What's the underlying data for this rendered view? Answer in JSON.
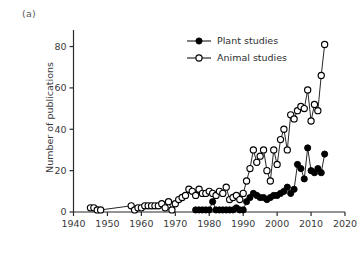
{
  "panel": {
    "label": "(a)"
  },
  "chart_data": {
    "type": "line",
    "title": "",
    "subtitle": "",
    "xlabel": "",
    "ylabel": "Number of publications",
    "xlim": [
      1940,
      2020
    ],
    "ylim": [
      0,
      88
    ],
    "xticks": [
      1940,
      1950,
      1960,
      1970,
      1980,
      1990,
      2000,
      2010,
      2020
    ],
    "yticks": [
      0,
      20,
      40,
      60,
      80
    ],
    "grid": false,
    "legend_position": "top-center",
    "marker_colors": {
      "plant": "#000000",
      "animal": "#ffffff"
    },
    "line_color": "#1a1a1a",
    "series": [
      {
        "name": "Plant studies",
        "marker": "filled-circle",
        "x": [
          1976,
          1977,
          1978,
          1979,
          1980,
          1981,
          1982,
          1983,
          1984,
          1985,
          1986,
          1987,
          1988,
          1989,
          1990,
          1991,
          1992,
          1993,
          1994,
          1995,
          1996,
          1997,
          1998,
          1999,
          2000,
          2001,
          2002,
          2003,
          2004,
          2005,
          2006,
          2007,
          2008,
          2009,
          2010,
          2011,
          2012,
          2013,
          2014
        ],
        "values": [
          1,
          1,
          1,
          1,
          1,
          5,
          1,
          1,
          1,
          1,
          1,
          1,
          2,
          1,
          1,
          5,
          7,
          9,
          8,
          7,
          7,
          6,
          7,
          8,
          8,
          9,
          10,
          12,
          9,
          11,
          23,
          21,
          16,
          31,
          20,
          19,
          21,
          19,
          28
        ]
      },
      {
        "name": "Animal studies",
        "marker": "open-circle",
        "x": [
          1945,
          1946,
          1947,
          1948,
          1957,
          1958,
          1959,
          1960,
          1961,
          1962,
          1963,
          1964,
          1965,
          1966,
          1967,
          1968,
          1969,
          1970,
          1971,
          1972,
          1973,
          1974,
          1975,
          1976,
          1977,
          1978,
          1979,
          1980,
          1981,
          1982,
          1983,
          1984,
          1985,
          1986,
          1987,
          1988,
          1989,
          1990,
          1991,
          1992,
          1993,
          1994,
          1995,
          1996,
          1997,
          1998,
          1999,
          2000,
          2001,
          2002,
          2003,
          2004,
          2005,
          2006,
          2007,
          2008,
          2009,
          2010,
          2011,
          2012,
          2013,
          2014
        ],
        "values": [
          2,
          2,
          1,
          1,
          3,
          1,
          2,
          2,
          3,
          3,
          3,
          3,
          3,
          4,
          2,
          5,
          1,
          4,
          6,
          7,
          8,
          11,
          10,
          8,
          11,
          9,
          9,
          10,
          9,
          8,
          10,
          9,
          12,
          6,
          7,
          8,
          6,
          9,
          15,
          21,
          30,
          24,
          27,
          30,
          20,
          15,
          30,
          23,
          35,
          40,
          30,
          47,
          45,
          49,
          51,
          50,
          59,
          44,
          52,
          49,
          66,
          81
        ]
      }
    ],
    "annotations": []
  }
}
